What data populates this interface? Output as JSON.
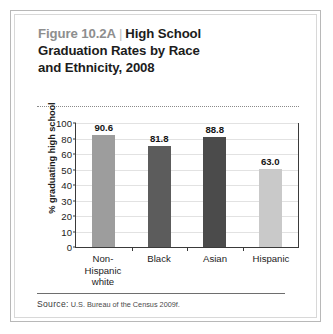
{
  "figure": {
    "number": "Figure 10.2A",
    "separator": "|",
    "title": "High School Graduation Rates by Race and Ethnicity, 2008",
    "title_line1": "High School",
    "title_line2": "Graduation Rates by Race",
    "title_line3": "and Ethnicity, 2008",
    "source_label": "Source:",
    "source_text": "U.S. Bureau of the Census 2009f."
  },
  "chart_data": {
    "type": "bar",
    "categories": [
      "Non-Hispanic white",
      "Black",
      "Asian",
      "Hispanic"
    ],
    "category_lines": [
      [
        "Non-Hispanic",
        "white"
      ],
      [
        "Black"
      ],
      [
        "Asian"
      ],
      [
        "Hispanic"
      ]
    ],
    "values": [
      90.6,
      81.8,
      88.8,
      63.0
    ],
    "value_labels": [
      "90.6",
      "81.8",
      "88.8",
      "63.0"
    ],
    "bar_colors": [
      "#9d9d9d",
      "#5c5c5c",
      "#4b4b4b",
      "#c9c9c9"
    ],
    "xlabel": "",
    "ylabel": "% graduating high school",
    "ylim": [
      0,
      100
    ],
    "ytick_labels": [
      "100",
      "80",
      "60",
      "50",
      "40",
      "30",
      "20",
      "10",
      "0"
    ],
    "ytick_values": [
      100,
      80,
      60,
      50,
      40,
      30,
      20,
      10,
      0
    ],
    "grid": true,
    "legend": false
  }
}
